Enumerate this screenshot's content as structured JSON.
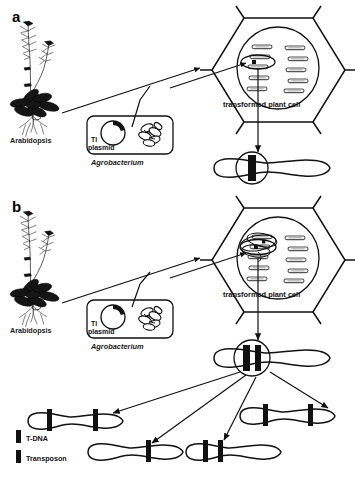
{
  "figure": {
    "background_color": "#ffffff",
    "ink_color": "#111111"
  },
  "panels": [
    {
      "id": "a",
      "letter": "a",
      "organism_label": "Arabidopsis",
      "vector_box": {
        "plasmid_label_line1": "Ti",
        "plasmid_label_line2": "plasmid",
        "organism_label": "Agrobacterium",
        "bacterium_icon": "bacterium-cluster-icon",
        "plasmid_icon": "circular-plasmid-icon"
      },
      "cell_label": "transformed plant cell",
      "cell_shape": "hexagon",
      "nucleus_shape": "circle",
      "chromosome_count_in_nucleus": 10,
      "highlighted_chromosome_marker": "single-ellipse",
      "product_chromosomes": [
        {
          "bands": [
            "T-DNA"
          ],
          "circled": true
        }
      ]
    },
    {
      "id": "b",
      "letter": "b",
      "organism_label": "Arabidopsis",
      "vector_box": {
        "plasmid_label_line1": "Ti",
        "plasmid_label_line2": "plasmid",
        "organism_label": "Agrobacterium",
        "bacterium_icon": "bacterium-cluster-icon",
        "plasmid_icon": "circular-plasmid-icon"
      },
      "cell_label": "transformed plant cell",
      "cell_shape": "hexagon",
      "nucleus_shape": "circle",
      "chromosome_count_in_nucleus": 10,
      "highlighted_chromosome_marker": "multiple-overlapping-ellipses",
      "parent_chromosome": {
        "bands": [
          "T-DNA",
          "Transposon"
        ],
        "circled": true
      },
      "product_chromosomes": [
        {
          "position": "left",
          "bands": [
            "T-DNA",
            "Transposon"
          ]
        },
        {
          "position": "lower-left",
          "bands": [
            "Transposon"
          ]
        },
        {
          "position": "lower-center",
          "bands": [
            "T-DNA",
            "Transposon"
          ]
        },
        {
          "position": "right",
          "bands": [
            "T-DNA",
            "Transposon"
          ]
        }
      ]
    }
  ],
  "legend": {
    "items": [
      {
        "swatch_color": "#111111",
        "label": "T-DNA"
      },
      {
        "swatch_color": "#111111",
        "label": "Transposon"
      }
    ]
  }
}
